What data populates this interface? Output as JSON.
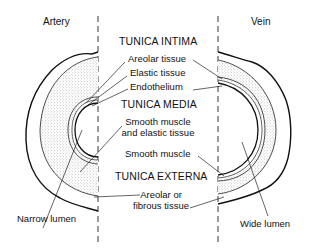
{
  "titles": {
    "artery": "Artery",
    "vein": "Vein"
  },
  "layers": {
    "intima": {
      "heading": "TUNICA INTIMA",
      "parts": [
        "Areolar tissue",
        "Elastic tissue",
        "Endothelium"
      ]
    },
    "media": {
      "heading": "TUNICA MEDIA",
      "artery_part_line1": "Smooth muscle",
      "artery_part_line2": "and elastic tissue",
      "vein_part": "Smooth muscle"
    },
    "externa": {
      "heading": "TUNICA EXTERNA",
      "part_line1": "Areolar or",
      "part_line2": "fibrous tissue"
    }
  },
  "lumen": {
    "artery": "Narrow lumen",
    "vein": "Wide lumen"
  },
  "colors": {
    "ink": "#111111",
    "stipple": "#bdbdbd",
    "background": "#ffffff"
  }
}
